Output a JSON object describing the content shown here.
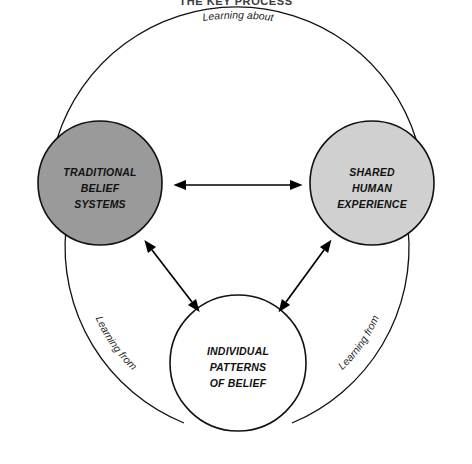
{
  "figure": {
    "title": "THE KEY PROCESS",
    "title_note": "cropped at top edge of image",
    "background_color": "#ffffff",
    "line_color": "#111111"
  },
  "nodes": [
    {
      "id": "traditional-belief-systems",
      "lines": [
        "TRADITIONAL",
        "BELIEF",
        "SYSTEMS"
      ],
      "fill": "#9a9a9a",
      "cx": 100,
      "cy": 183,
      "r": 62
    },
    {
      "id": "shared-human-experience",
      "lines": [
        "SHARED",
        "HUMAN",
        "EXPERIENCE"
      ],
      "fill": "#d0d0d0",
      "cx": 372,
      "cy": 183,
      "r": 62
    },
    {
      "id": "individual-patterns-of-belief",
      "lines": [
        "INDIVIDUAL",
        "PATTERNS",
        "OF BELIEF"
      ],
      "fill": "#ffffff",
      "cx": 238,
      "cy": 363,
      "r": 68
    }
  ],
  "arc_labels": {
    "top": "Learning about",
    "lower_left": "Learning from",
    "lower_right": "Learning from"
  },
  "arrows": [
    {
      "id": "traditional-to-shared",
      "from": "traditional-belief-systems",
      "to": "shared-human-experience",
      "style": "double-headed"
    },
    {
      "id": "traditional-to-individual",
      "from": "traditional-belief-systems",
      "to": "individual-patterns-of-belief",
      "style": "double-headed"
    },
    {
      "id": "shared-to-individual",
      "from": "shared-human-experience",
      "to": "individual-patterns-of-belief",
      "style": "double-headed"
    }
  ]
}
